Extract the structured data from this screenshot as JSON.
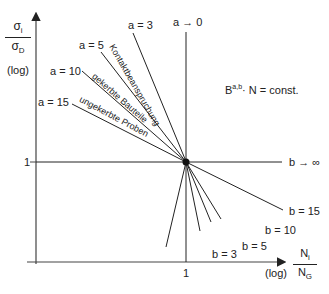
{
  "diagram": {
    "y_axis": {
      "label_numerator": "σ",
      "label_numerator_sub": "i",
      "label_denominator": "σ",
      "label_denominator_sub": "D",
      "scale": "(log)",
      "tick_label": "1"
    },
    "x_axis": {
      "label_numerator": "N",
      "label_numerator_sub": "i",
      "label_denominator": "N",
      "label_denominator_sub": "G",
      "scale": "(log)",
      "tick_label": "1"
    },
    "formula": {
      "base": "B",
      "superscript": "a,b",
      "rest": "· N = const."
    },
    "upper_labels": [
      "a = 3",
      "a = 5",
      "a = 10",
      "a = 15",
      "a → 0"
    ],
    "lower_labels": [
      "b = 3",
      "b = 5",
      "b = 10",
      "b = 15",
      "b → ∞"
    ],
    "curve_labels": {
      "kontakt": "Kontaktbeanspruchung",
      "gekerbt": "gekerbte Bauteile",
      "ungekerbt": "ungekerbte Proben"
    },
    "colors": {
      "line": "#222222",
      "background": "#ffffff"
    }
  }
}
